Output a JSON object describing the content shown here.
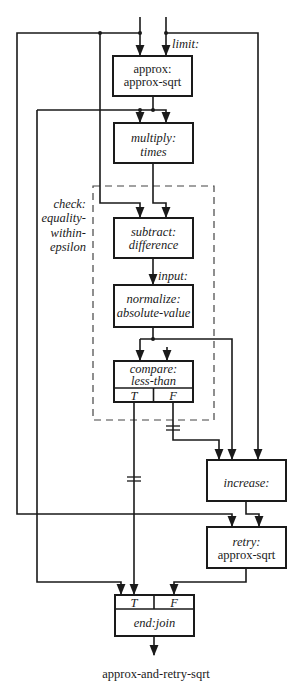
{
  "diagram": {
    "inputs": {
      "limit_label": "limit:"
    },
    "group": {
      "label_lines": [
        "check:",
        "equality-",
        "within-",
        "epsilon"
      ]
    },
    "nodes": {
      "approx": {
        "lines": [
          "approx:",
          "approx-sqrt"
        ]
      },
      "multiply": {
        "lines": [
          "multiply:",
          "times"
        ]
      },
      "subtract": {
        "lines": [
          "subtract:",
          "difference"
        ]
      },
      "normalize": {
        "lines": [
          "normalize:",
          "absolute-value"
        ],
        "input_label": "input:"
      },
      "compare": {
        "lines": [
          "compare:",
          "less-than"
        ],
        "ports": [
          "T",
          "F"
        ]
      },
      "increase": {
        "lines": [
          "increase:"
        ]
      },
      "retry": {
        "lines": [
          "retry:",
          "approx-sqrt"
        ]
      },
      "end": {
        "lines": [
          "end:join"
        ],
        "ports": [
          "T",
          "F"
        ]
      }
    },
    "output": {
      "label": "approx-and-retry-sqrt"
    },
    "colors": {
      "ink": "#1a1a1a",
      "background": "#ffffff",
      "dashed": "#444444"
    }
  }
}
